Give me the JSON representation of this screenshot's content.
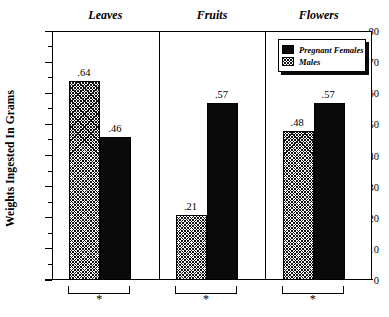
{
  "chart_data": {
    "type": "bar",
    "title": "",
    "xlabel": "",
    "ylabel": "Weights Ingested In Grams",
    "ylim": [
      0,
      0.8
    ],
    "ytick_labels": [
      "0",
      ".10",
      ".20",
      ".30",
      ".40",
      ".50",
      ".60",
      ".70",
      ".80"
    ],
    "ytick_values": [
      0,
      0.1,
      0.2,
      0.3,
      0.4,
      0.5,
      0.6,
      0.7,
      0.8
    ],
    "minor_tick_values": [
      0.05,
      0.15,
      0.25,
      0.35,
      0.45,
      0.55,
      0.65,
      0.75
    ],
    "grid": false,
    "legend_position": "top-right",
    "panels": [
      "Leaves",
      "Fruits",
      "Flowers"
    ],
    "categories": [
      "Leaves",
      "Fruits",
      "Flowers"
    ],
    "series": [
      {
        "name": "Males",
        "fill": "hatch",
        "values": [
          0.64,
          0.21,
          0.48
        ],
        "labels": [
          ".64",
          ".21",
          ".48"
        ]
      },
      {
        "name": "Pregnant Females",
        "fill": "solid",
        "values": [
          0.46,
          0.57,
          0.57
        ],
        "labels": [
          ".46",
          ".57",
          ".57"
        ]
      }
    ],
    "annotations": [
      {
        "panel": "Leaves",
        "marker": "*"
      },
      {
        "panel": "Fruits",
        "marker": "*"
      },
      {
        "panel": "Flowers",
        "marker": "*"
      }
    ]
  },
  "legend": {
    "entries": [
      {
        "label": "Pregnant Females",
        "fill": "solid"
      },
      {
        "label": "Males",
        "fill": "hatch"
      }
    ]
  },
  "axis": {
    "y_title": "Weights Ingested In Grams",
    "ticks": [
      {
        "label": ".80",
        "value": 0.8
      },
      {
        "label": ".70",
        "value": 0.7
      },
      {
        "label": ".60",
        "value": 0.6
      },
      {
        "label": ".50",
        "value": 0.5
      },
      {
        "label": ".40",
        "value": 0.4
      },
      {
        "label": ".30",
        "value": 0.3
      },
      {
        "label": ".20",
        "value": 0.2
      },
      {
        "label": ".10",
        "value": 0.1
      },
      {
        "label": "0",
        "value": 0.0
      }
    ]
  },
  "panels": [
    {
      "title": "Leaves",
      "significance": "*",
      "bars": [
        {
          "series": "Males",
          "fill": "hatch",
          "value": 0.64,
          "label": ".64"
        },
        {
          "series": "Pregnant Females",
          "fill": "solid",
          "value": 0.46,
          "label": ".46"
        }
      ]
    },
    {
      "title": "Fruits",
      "significance": "*",
      "bars": [
        {
          "series": "Males",
          "fill": "hatch",
          "value": 0.21,
          "label": ".21"
        },
        {
          "series": "Pregnant Females",
          "fill": "solid",
          "value": 0.57,
          "label": ".57"
        }
      ]
    },
    {
      "title": "Flowers",
      "significance": "*",
      "bars": [
        {
          "series": "Males",
          "fill": "hatch",
          "value": 0.48,
          "label": ".48"
        },
        {
          "series": "Pregnant Females",
          "fill": "solid",
          "value": 0.57,
          "label": ".57"
        }
      ]
    }
  ],
  "colors": {
    "ink": "#000000",
    "solid_fill": "#0a0a0a",
    "background": "#ffffff"
  }
}
